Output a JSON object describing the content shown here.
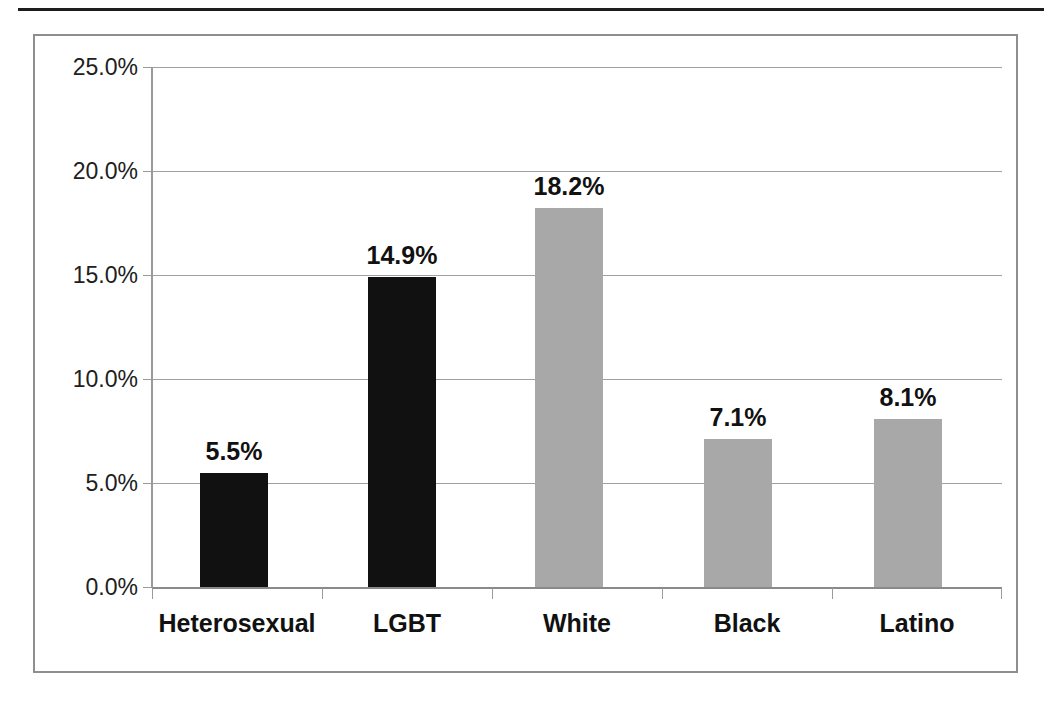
{
  "chart_data": {
    "type": "bar",
    "title": "",
    "subtitle": "",
    "xlabel": "",
    "ylabel": "",
    "categories": [
      "Heterosexual",
      "LGBT",
      "White",
      "Black",
      "Latino"
    ],
    "values": [
      5.5,
      14.9,
      18.2,
      7.1,
      8.1
    ],
    "value_labels": [
      "5.5%",
      "14.9%",
      "18.2%",
      "7.1%",
      "8.1%"
    ],
    "bar_colors": [
      "#111111",
      "#111111",
      "#a8a8a8",
      "#a8a8a8",
      "#a8a8a8"
    ],
    "ylim": [
      0,
      25
    ],
    "y_ticks": [
      0,
      5,
      10,
      15,
      20,
      25
    ],
    "y_tick_labels": [
      "0.0%",
      "5.0%",
      "10.0%",
      "15.0%",
      "20.0%",
      "25.0%"
    ],
    "grid": true,
    "grid_axis": "y",
    "legend": false,
    "legend_position": "none",
    "annotations": []
  },
  "colors": {
    "bar_dark": "#111111",
    "bar_light": "#a8a8a8",
    "gridline": "#a0a0a0",
    "axis": "#8a8a8a",
    "frame": "#8e8e8e",
    "top_rule": "#1d1d1d",
    "text": "#111111"
  }
}
